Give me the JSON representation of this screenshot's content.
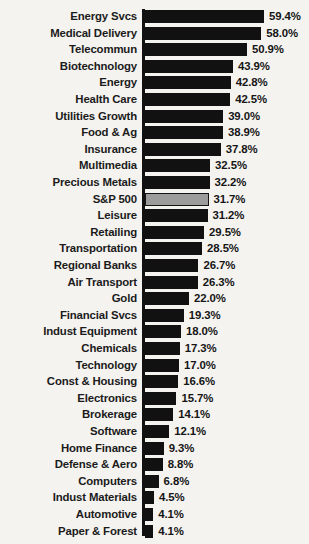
{
  "chart_data": {
    "type": "bar",
    "orientation": "horizontal",
    "title": "",
    "subtitle": "",
    "xlabel": "",
    "ylabel": "",
    "grid": false,
    "legend": "none",
    "xlim": [
      0,
      59.4
    ],
    "value_suffix": "%",
    "highlight_category": "S&P 500",
    "highlight_color": "#9c9c9c",
    "bar_color": "#111111",
    "background_color": "#f5f3f0",
    "categories": [
      "Energy Svcs",
      "Medical Delivery",
      "Telecommun",
      "Biotechnology",
      "Energy",
      "Health Care",
      "Utilities Growth",
      "Food & Ag",
      "Insurance",
      "Multimedia",
      "Precious Metals",
      "S&P 500",
      "Leisure",
      "Retailing",
      "Transportation",
      "Regional Banks",
      "Air Transport",
      "Gold",
      "Financial Svcs",
      "Indust Equipment",
      "Chemicals",
      "Technology",
      "Const & Housing",
      "Electronics",
      "Brokerage",
      "Software",
      "Home Finance",
      "Defense & Aero",
      "Computers",
      "Indust Materials",
      "Automotive",
      "Paper & Forest"
    ],
    "values": [
      59.4,
      58.0,
      50.9,
      43.9,
      42.8,
      42.5,
      39.0,
      38.9,
      37.8,
      32.5,
      32.2,
      31.7,
      31.2,
      29.5,
      28.5,
      26.7,
      26.3,
      22.0,
      19.3,
      18.0,
      17.3,
      17.0,
      16.6,
      15.7,
      14.1,
      12.1,
      9.3,
      8.8,
      6.8,
      4.5,
      4.1,
      4.1
    ],
    "value_labels": [
      "59.4%",
      "58.0%",
      "50.9%",
      "43.9%",
      "42.8%",
      "42.5%",
      "39.0%",
      "38.9%",
      "37.8%",
      "32.5%",
      "32.2%",
      "31.7%",
      "31.2%",
      "29.5%",
      "28.5%",
      "26.7%",
      "26.3%",
      "22.0%",
      "19.3%",
      "18.0%",
      "17.3%",
      "17.0%",
      "16.6%",
      "15.7%",
      "14.1%",
      "12.1%",
      "9.3%",
      "8.8%",
      "6.8%",
      "4.5%",
      "4.1%",
      "4.1%"
    ]
  }
}
